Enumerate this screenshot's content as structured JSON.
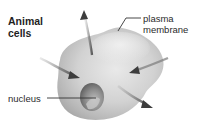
{
  "figure": {
    "title_lines": [
      "Animal",
      "cells"
    ],
    "labels": {
      "plasma_membrane": [
        "plasma",
        "membrane"
      ],
      "nucleus": "nucleus"
    },
    "colors": {
      "cell_light": "#e6e6e6",
      "cell_mid": "#c9c9c9",
      "cell_dark": "#9e9e9e",
      "nucleus_dark": "#6f6f6f",
      "arrow": "#5a5a5a",
      "arrowhead": "#3d3d3d",
      "text": "#2b2b2b",
      "leader_line": "#333333"
    },
    "arrows": [
      {
        "name": "arrow-out-up",
        "direction": "outward"
      },
      {
        "name": "arrow-in-left",
        "direction": "inward"
      },
      {
        "name": "arrow-in-right",
        "direction": "inward"
      },
      {
        "name": "arrow-out-down-right",
        "direction": "outward"
      }
    ]
  }
}
